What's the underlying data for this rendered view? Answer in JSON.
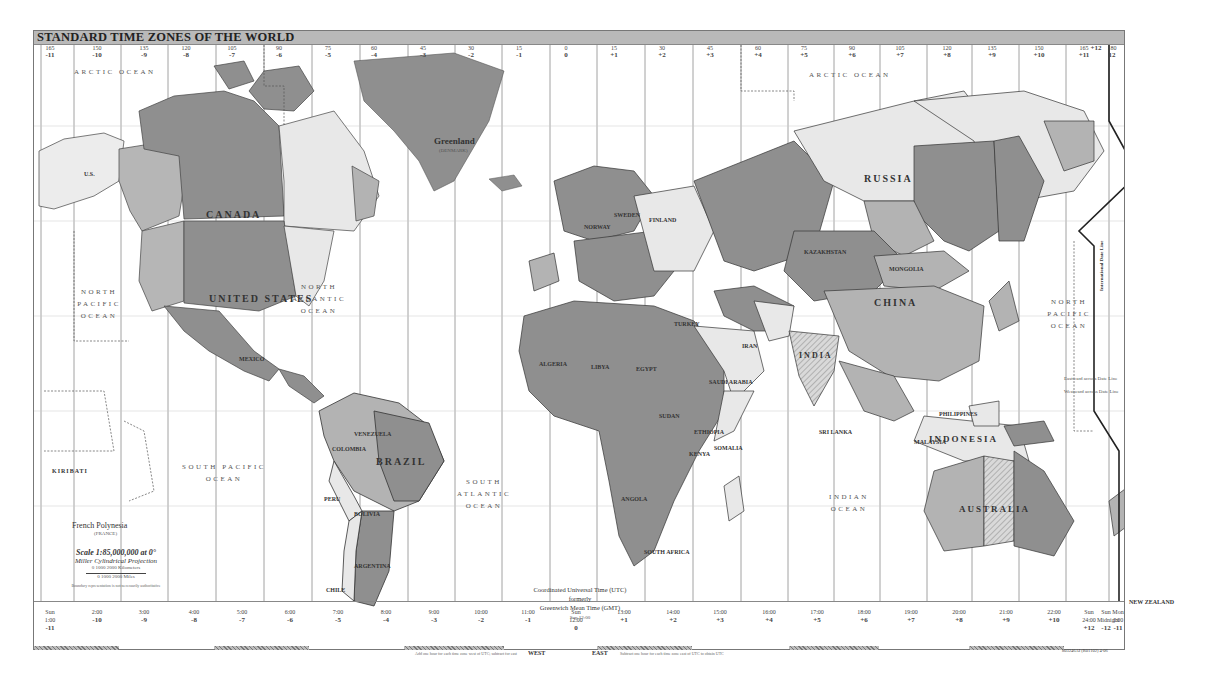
{
  "title": "STANDARD TIME ZONES OF THE WORLD",
  "colors": {
    "background": "#ffffff",
    "title_bar": "#b9b9b9",
    "land_dark": "#8c8c8c",
    "land_medium": "#b3b3b3",
    "land_light": "#e6e6e6",
    "land_hatched": "#cfcfcf",
    "border": "#333333",
    "zone_line": "#7a7a7a"
  },
  "top_zones": [
    {
      "x": 16,
      "meridian": "165",
      "offset": "-11"
    },
    {
      "x": 63,
      "meridian": "150",
      "offset": "-10"
    },
    {
      "x": 110,
      "meridian": "135",
      "offset": "-9"
    },
    {
      "x": 152,
      "meridian": "120",
      "offset": "-8"
    },
    {
      "x": 198,
      "meridian": "105",
      "offset": "-7"
    },
    {
      "x": 245,
      "meridian": "90",
      "offset": "-6"
    },
    {
      "x": 294,
      "meridian": "75",
      "offset": "-5"
    },
    {
      "x": 340,
      "meridian": "60",
      "offset": "-4"
    },
    {
      "x": 389,
      "meridian": "45",
      "offset": "-3"
    },
    {
      "x": 437,
      "meridian": "30",
      "offset": "-2"
    },
    {
      "x": 485,
      "meridian": "15",
      "offset": "-1"
    },
    {
      "x": 532,
      "meridian": "0",
      "offset": "0"
    },
    {
      "x": 580,
      "meridian": "15",
      "offset": "+1"
    },
    {
      "x": 628,
      "meridian": "30",
      "offset": "+2"
    },
    {
      "x": 676,
      "meridian": "45",
      "offset": "+3"
    },
    {
      "x": 724,
      "meridian": "60",
      "offset": "+4"
    },
    {
      "x": 770,
      "meridian": "75",
      "offset": "+5"
    },
    {
      "x": 818,
      "meridian": "90",
      "offset": "+6"
    },
    {
      "x": 866,
      "meridian": "105",
      "offset": "+7"
    },
    {
      "x": 913,
      "meridian": "120",
      "offset": "+8"
    },
    {
      "x": 958,
      "meridian": "135",
      "offset": "+9"
    },
    {
      "x": 1005,
      "meridian": "150",
      "offset": "+10"
    },
    {
      "x": 1050,
      "meridian": "165",
      "offset": "+11"
    },
    {
      "x": 1083,
      "meridian": "",
      "offset": "+12"
    },
    {
      "x": 1111,
      "meridian": "180",
      "offset": "12"
    },
    {
      "x": 1139,
      "meridian": "",
      "offset": "-11"
    }
  ],
  "bottom_zones": [
    {
      "x": 16,
      "time": "1:00",
      "offset": "-11",
      "prefix": "Sun"
    },
    {
      "x": 63,
      "time": "2:00",
      "offset": "-10",
      "prefix": ""
    },
    {
      "x": 110,
      "time": "3:00",
      "offset": "-9",
      "prefix": ""
    },
    {
      "x": 160,
      "time": "4:00",
      "offset": "-8",
      "prefix": ""
    },
    {
      "x": 208,
      "time": "5:00",
      "offset": "-7",
      "prefix": ""
    },
    {
      "x": 256,
      "time": "6:00",
      "offset": "-6",
      "prefix": ""
    },
    {
      "x": 304,
      "time": "7:00",
      "offset": "-5",
      "prefix": ""
    },
    {
      "x": 352,
      "time": "8:00",
      "offset": "-4",
      "prefix": ""
    },
    {
      "x": 400,
      "time": "9:00",
      "offset": "-3",
      "prefix": ""
    },
    {
      "x": 447,
      "time": "10:00",
      "offset": "-2",
      "prefix": ""
    },
    {
      "x": 494,
      "time": "11:00",
      "offset": "-1",
      "prefix": ""
    },
    {
      "x": 542,
      "time": "12:00",
      "offset": "0",
      "prefix": "Sun"
    },
    {
      "x": 590,
      "time": "13:00",
      "offset": "+1",
      "prefix": ""
    },
    {
      "x": 639,
      "time": "14:00",
      "offset": "+2",
      "prefix": ""
    },
    {
      "x": 686,
      "time": "15:00",
      "offset": "+3",
      "prefix": ""
    },
    {
      "x": 735,
      "time": "16:00",
      "offset": "+4",
      "prefix": ""
    },
    {
      "x": 783,
      "time": "17:00",
      "offset": "+5",
      "prefix": ""
    },
    {
      "x": 830,
      "time": "18:00",
      "offset": "+6",
      "prefix": ""
    },
    {
      "x": 877,
      "time": "19:00",
      "offset": "+7",
      "prefix": ""
    },
    {
      "x": 925,
      "time": "20:00",
      "offset": "+8",
      "prefix": ""
    },
    {
      "x": 972,
      "time": "21:00",
      "offset": "+9",
      "prefix": ""
    },
    {
      "x": 1020,
      "time": "22:00",
      "offset": "+10",
      "prefix": ""
    },
    {
      "x": 1068,
      "time": "23:00",
      "offset": "+11",
      "prefix": ""
    },
    {
      "x": 1105,
      "time": "24:00",
      "offset": "+12",
      "prefix": "Sun"
    },
    {
      "x": 1131,
      "time": "Midnight",
      "offset": "-12",
      "prefix": "Sun"
    },
    {
      "x": 1155,
      "time": "1:00",
      "offset": "-11",
      "prefix": "Mon"
    }
  ],
  "oceans": [
    {
      "name": "ARCTIC OCEAN",
      "x": 40,
      "y": 35
    },
    {
      "name": "ARCTIC OCEAN",
      "x": 775,
      "y": 38
    },
    {
      "name": "NORTH PACIFIC OCEAN",
      "x": 40,
      "y": 255
    },
    {
      "name": "NORTH ATLANTIC OCEAN",
      "x": 255,
      "y": 250
    },
    {
      "name": "SOUTH PACIFIC OCEAN",
      "x": 145,
      "y": 430
    },
    {
      "name": "SOUTH ATLANTIC OCEAN",
      "x": 420,
      "y": 445
    },
    {
      "name": "INDIAN OCEAN",
      "x": 790,
      "y": 460
    },
    {
      "name": "NORTH PACIFIC OCEAN",
      "x": 1010,
      "y": 265
    }
  ],
  "countries_large": [
    {
      "name": "CANADA",
      "x": 172,
      "y": 178
    },
    {
      "name": "UNITED STATES",
      "x": 175,
      "y": 265
    },
    {
      "name": "RUSSIA",
      "x": 830,
      "y": 145
    },
    {
      "name": "CHINA",
      "x": 840,
      "y": 268
    },
    {
      "name": "BRAZIL",
      "x": 342,
      "y": 428
    },
    {
      "name": "INDONESIA",
      "x": 895,
      "y": 405
    },
    {
      "name": "AUSTRALIA",
      "x": 960,
      "y": 475
    },
    {
      "name": "INDIA",
      "x": 765,
      "y": 322
    }
  ],
  "countries_small": [
    {
      "name": "Greenland",
      "x": 420,
      "y": 108
    },
    {
      "name": "(DENMARK)",
      "x": 425,
      "y": 120
    },
    {
      "name": "U.S.",
      "x": 50,
      "y": 140
    },
    {
      "name": "MEXICO",
      "x": 205,
      "y": 325
    },
    {
      "name": "ALGERIA",
      "x": 535,
      "y": 330
    },
    {
      "name": "LIBYA",
      "x": 587,
      "y": 333
    },
    {
      "name": "EGYPT",
      "x": 632,
      "y": 335
    },
    {
      "name": "SAUDI ARABIA",
      "x": 705,
      "y": 348
    },
    {
      "name": "IRAN",
      "x": 738,
      "y": 312
    },
    {
      "name": "SUDAN",
      "x": 655,
      "y": 382
    },
    {
      "name": "ETHIOPIA",
      "x": 690,
      "y": 398
    },
    {
      "name": "SOMALIA",
      "x": 710,
      "y": 414
    },
    {
      "name": "KENYA",
      "x": 685,
      "y": 420
    },
    {
      "name": "ANGOLA",
      "x": 617,
      "y": 465
    },
    {
      "name": "SOUTH AFRICA",
      "x": 640,
      "y": 520
    },
    {
      "name": "MONGOLIA",
      "x": 885,
      "y": 258
    },
    {
      "name": "KAZAKHSTAN",
      "x": 790,
      "y": 268
    },
    {
      "name": "PHILIPPINES",
      "x": 935,
      "y": 383
    },
    {
      "name": "MALAYSIA",
      "x": 910,
      "y": 410
    },
    {
      "name": "PERU",
      "x": 320,
      "y": 470
    },
    {
      "name": "BOLIVIA",
      "x": 350,
      "y": 483
    },
    {
      "name": "ARGENTINA",
      "x": 350,
      "y": 535
    },
    {
      "name": "CHILE",
      "x": 325,
      "y": 558
    },
    {
      "name": "COLOMBIA",
      "x": 328,
      "y": 418
    },
    {
      "name": "VENEZUELA",
      "x": 350,
      "y": 403
    },
    {
      "name": "KIRIBATI",
      "x": 48,
      "y": 437
    },
    {
      "name": "French Polynesia",
      "x": 68,
      "y": 492
    },
    {
      "name": "(FRANCE)",
      "x": 90,
      "y": 500
    },
    {
      "name": "NEW ZEALAND",
      "x": 1125,
      "y": 570
    },
    {
      "name": "NORWAY",
      "x": 580,
      "y": 193
    },
    {
      "name": "SWEDEN",
      "x": 610,
      "y": 184
    },
    {
      "name": "FINLAND",
      "x": 645,
      "y": 188
    },
    {
      "name": "TURKEY",
      "x": 670,
      "y": 290
    },
    {
      "name": "SRI LANKA",
      "x": 815,
      "y": 400
    }
  ],
  "legend": {
    "scale_title": "Scale 1:85,000,000 at 0°",
    "projection": "Miller Cylindrical Projection",
    "scale_km": "0    1000    2000 Kilometers",
    "scale_mi": "0    1000    2000 Miles",
    "scale_note": "Boundary representation is not necessarily authoritative"
  },
  "utc": {
    "line1": "Coordinated Universal Time (UTC)",
    "line2": "formerly",
    "line3": "Greenwich Mean Time (GMT)",
    "noon_label": "Sun 12:00"
  },
  "directions": {
    "west": "WEST",
    "east": "EAST",
    "west_note": "Add one hour for each time zone west of UTC; subtract for east",
    "east_note": "Subtract one hour for each time zone east of UTC to obtain UTC"
  },
  "date_line": {
    "label": "International Date Line",
    "eastward": "Eastward across Date Line",
    "westward": "Westward across Date Line"
  },
  "map_id": "803246AI (R01102) 4-06"
}
